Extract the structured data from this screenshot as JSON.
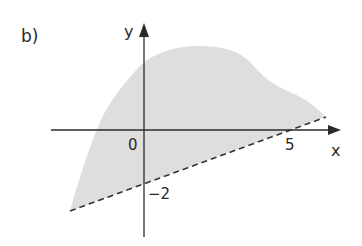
{
  "figure": {
    "part_label": "b)",
    "x_axis_label": "x",
    "y_axis_label": "y",
    "origin_label": "0",
    "x_tick_label": "5",
    "y_tick_label": "−2",
    "colors": {
      "region_fill": "#dedede",
      "axis": "#2b2b2b",
      "boundary_dashed": "#333333",
      "text": "#2a2a2a"
    },
    "region": {
      "description": "Shaded region above the dashed line y = 0.4x - 2",
      "boundary_line": {
        "style": "dashed",
        "x_intercept": 5,
        "y_intercept": -2
      }
    }
  }
}
